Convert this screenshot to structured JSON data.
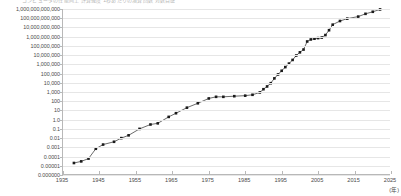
{
  "title_strip": "コンピュータの性能向上   計算速度   1秒あたりの演算回数   対数目盛",
  "axis": {
    "x_unit_label": "(年)",
    "y_tick_labels": [
      "1,000,000,000,000",
      "100,000,000,000",
      "10,000,000,000",
      "1,000,000,000",
      "100,000,000",
      "10,000,000",
      "1,000,000",
      "100,000",
      "10,000",
      "1,000",
      "100",
      "10",
      "1.0",
      "0.1",
      "0.01",
      "0.001",
      "0.0001",
      "0.00001",
      "0.000000"
    ],
    "x_tick_labels": [
      "1935",
      "1945",
      "1955",
      "1965",
      "1975",
      "1985",
      "1995",
      "2005",
      "2015",
      "2025"
    ]
  },
  "chart_data": {
    "type": "line",
    "title": "",
    "xlabel": "(年)",
    "ylabel": "",
    "log_y": true,
    "xlim": [
      1935,
      2025
    ],
    "ylim": [
      1e-06,
      1000000000000
    ],
    "grid": true,
    "legend": "none",
    "marker": "square",
    "series": [
      {
        "name": "計算性能",
        "x": [
          1938,
          1940,
          1942,
          1944,
          1946,
          1949,
          1951,
          1953,
          1956,
          1959,
          1961,
          1964,
          1966,
          1969,
          1972,
          1975,
          1977,
          1979,
          1982,
          1985,
          1987,
          1989,
          1990,
          1991,
          1992,
          1993,
          1994,
          1995,
          1996,
          1997,
          1998,
          1999,
          2000,
          2001,
          2002,
          2003,
          2004,
          2005,
          2006,
          2007,
          2008,
          2009,
          2011,
          2013,
          2016,
          2018,
          2020,
          2022
        ],
        "y": [
          2e-05,
          3e-05,
          6e-05,
          0.0007,
          0.002,
          0.004,
          0.01,
          0.02,
          0.1,
          0.3,
          0.4,
          2,
          5,
          20,
          60,
          200,
          300,
          300,
          350,
          400,
          500,
          900,
          2000,
          4000,
          9000,
          30000,
          80000,
          200000,
          500000,
          1200000,
          3000000,
          9000000,
          20000000,
          40000000,
          300000000,
          500000000,
          600000000,
          700000000,
          800000000,
          1500000000,
          5000000000,
          20000000000,
          50000000000,
          90000000000,
          150000000000,
          300000000000,
          500000000000,
          900000000000
        ]
      }
    ]
  }
}
